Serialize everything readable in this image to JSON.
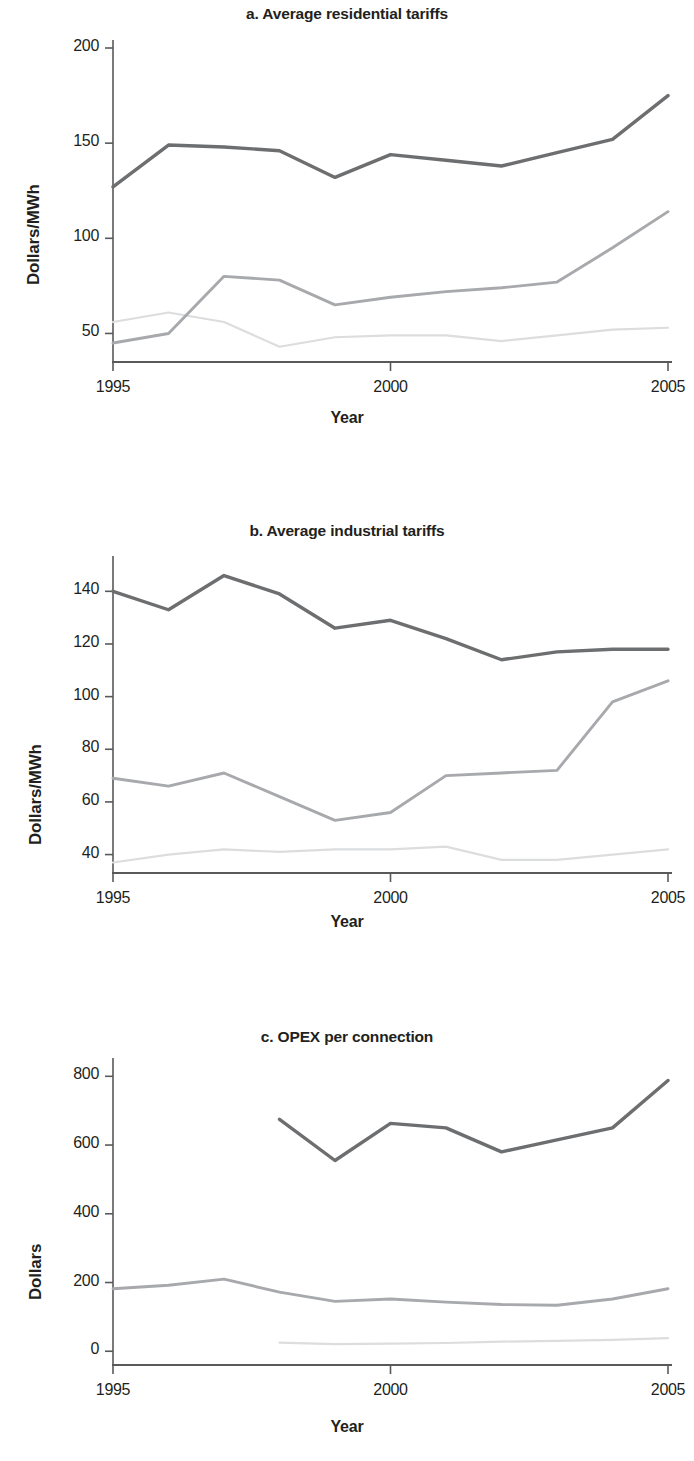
{
  "figure": {
    "xlabel": "Year",
    "panels": [
      "a",
      "b",
      "c"
    ]
  },
  "panel_a": {
    "title": "a. Average residential tariffs",
    "ylabel": "Dollars/MWh",
    "xlabel": "Year",
    "yticks": [
      "50",
      "100",
      "150",
      "200"
    ],
    "xticks": [
      "1995",
      "2000",
      "2005"
    ]
  },
  "panel_b": {
    "title": "b. Average industrial tariffs",
    "ylabel": "Dollars/MWh",
    "xlabel": "Year",
    "yticks": [
      "40",
      "60",
      "80",
      "100",
      "120",
      "140"
    ],
    "xticks": [
      "1995",
      "2000",
      "2005"
    ]
  },
  "panel_c": {
    "title": "c. OPEX per connection",
    "ylabel": "Dollars",
    "xlabel": "Year",
    "yticks": [
      "0",
      "200",
      "400",
      "600",
      "800"
    ],
    "xticks": [
      "1995",
      "2000",
      "2005"
    ]
  },
  "colors": {
    "dark": "#6d6e70",
    "medium": "#a7a9ac",
    "light": "#dcdddf",
    "axis": "#58595b",
    "text": "#231f20"
  },
  "chart_data": [
    {
      "type": "line",
      "panel": "a",
      "title": "a. Average residential tariffs",
      "xlabel": "Year",
      "ylabel": "Dollars/MWh",
      "x": [
        1995,
        1996,
        1997,
        1998,
        1999,
        2000,
        2001,
        2002,
        2003,
        2004,
        2005
      ],
      "xlim": [
        1995,
        2005
      ],
      "ylim": [
        35,
        200
      ],
      "yticks": [
        50,
        100,
        150,
        200
      ],
      "xticks": [
        1995,
        2000,
        2005
      ],
      "grid": false,
      "legend": "none",
      "series": [
        {
          "name": "dark-line",
          "color": "#6d6e70",
          "values": [
            127,
            149,
            148,
            146,
            132,
            144,
            141,
            138,
            145,
            152,
            175
          ]
        },
        {
          "name": "medium-line",
          "color": "#a7a9ac",
          "values": [
            45,
            50,
            80,
            78,
            65,
            69,
            72,
            74,
            77,
            95,
            114
          ]
        },
        {
          "name": "light-line",
          "color": "#dcdddf",
          "values": [
            56,
            61,
            56,
            43,
            48,
            49,
            49,
            46,
            49,
            52,
            53
          ]
        }
      ]
    },
    {
      "type": "line",
      "panel": "b",
      "title": "b. Average industrial tariffs",
      "xlabel": "Year",
      "ylabel": "Dollars/MWh",
      "x": [
        1995,
        1996,
        1997,
        1998,
        1999,
        2000,
        2001,
        2002,
        2003,
        2004,
        2005
      ],
      "xlim": [
        1995,
        2005
      ],
      "ylim": [
        33,
        150
      ],
      "yticks": [
        40,
        60,
        80,
        100,
        120,
        140
      ],
      "xticks": [
        1995,
        2000,
        2005
      ],
      "grid": false,
      "legend": "none",
      "series": [
        {
          "name": "dark-line",
          "color": "#6d6e70",
          "values": [
            140,
            133,
            146,
            139,
            126,
            129,
            122,
            114,
            117,
            118,
            118
          ]
        },
        {
          "name": "medium-line",
          "color": "#a7a9ac",
          "values": [
            69,
            66,
            71,
            62,
            53,
            56,
            70,
            71,
            72,
            98,
            106
          ]
        },
        {
          "name": "light-line",
          "color": "#dcdddf",
          "values": [
            37,
            40,
            42,
            41,
            42,
            42,
            43,
            38,
            38,
            40,
            42
          ]
        }
      ]
    },
    {
      "type": "line",
      "panel": "c",
      "title": "c. OPEX per connection",
      "xlabel": "Year",
      "ylabel": "Dollars",
      "x": [
        1995,
        1996,
        1997,
        1998,
        1999,
        2000,
        2001,
        2002,
        2003,
        2004,
        2005
      ],
      "xlim": [
        1995,
        2005
      ],
      "ylim": [
        -40,
        830
      ],
      "yticks": [
        0,
        200,
        400,
        600,
        800
      ],
      "xticks": [
        1995,
        2000,
        2005
      ],
      "grid": false,
      "legend": "none",
      "series": [
        {
          "name": "dark-line",
          "color": "#6d6e70",
          "x": [
            1998,
            1999,
            2000,
            2001,
            2002,
            2003,
            2004,
            2005
          ],
          "values": [
            675,
            555,
            663,
            650,
            580,
            615,
            650,
            788
          ]
        },
        {
          "name": "medium-line",
          "color": "#a7a9ac",
          "x": [
            1995,
            1996,
            1997,
            1998,
            1999,
            2000,
            2001,
            2002,
            2003,
            2004,
            2005
          ],
          "values": [
            182,
            192,
            210,
            172,
            145,
            152,
            143,
            136,
            134,
            152,
            182
          ]
        },
        {
          "name": "light-line",
          "color": "#dcdddf",
          "x": [
            1998,
            1999,
            2000,
            2001,
            2002,
            2003,
            2004,
            2005
          ],
          "values": [
            25,
            21,
            22,
            24,
            28,
            30,
            33,
            38
          ]
        }
      ]
    }
  ]
}
